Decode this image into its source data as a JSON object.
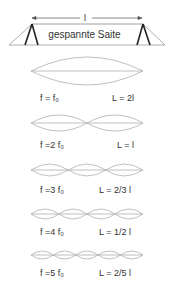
{
  "header": {
    "length_label": "l",
    "string_label": "gespannte Saite"
  },
  "modes": [
    {
      "n": 1,
      "freq_label": "f = f₀",
      "wavelength_label": "L = 2l"
    },
    {
      "n": 2,
      "freq_label": "f =2 f₀",
      "wavelength_label": "L = l"
    },
    {
      "n": 3,
      "freq_label": "f =3 f₀",
      "wavelength_label": "L = 2/3 l"
    },
    {
      "n": 4,
      "freq_label": "f =4 f₀",
      "wavelength_label": "L = 1/2 l"
    },
    {
      "n": 5,
      "freq_label": "f =5 f₀",
      "wavelength_label": "L = 2/5 l"
    }
  ],
  "colors": {
    "wave": "#aaaaaa",
    "bridge": "#222222",
    "text": "#333333"
  }
}
